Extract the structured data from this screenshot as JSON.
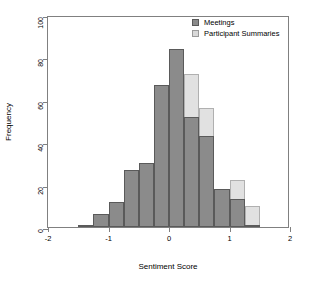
{
  "chart_data": {
    "type": "bar",
    "subtype": "overlapping-histogram",
    "title": "",
    "xlabel": "Sentiment Score",
    "ylabel": "Frequency",
    "xlim": [
      -2,
      2
    ],
    "ylim": [
      0,
      100
    ],
    "xticks": [
      -2,
      -1,
      0,
      1,
      2
    ],
    "xtick_labels": [
      "-2",
      "-1",
      "0",
      "1",
      "2"
    ],
    "yticks": [
      0,
      20,
      40,
      60,
      80,
      100
    ],
    "ytick_labels": [
      "0",
      "20",
      "40",
      "60",
      "80",
      "100"
    ],
    "grid": false,
    "legend_position": "top-right",
    "bin_width": 0.25,
    "bin_edges": [
      -1.5,
      -1.25,
      -1.0,
      -0.75,
      -0.5,
      -0.25,
      0.0,
      0.25,
      0.5,
      0.75,
      1.0,
      1.25,
      1.5
    ],
    "bin_centers": [
      -1.375,
      -1.125,
      -0.875,
      -0.625,
      -0.375,
      -0.125,
      0.125,
      0.375,
      0.625,
      0.875,
      1.125,
      1.375
    ],
    "series": [
      {
        "name": "Meetings",
        "color": "#8b8b8b",
        "values": [
          1,
          6,
          12,
          27,
          30,
          67,
          84,
          52,
          43,
          18,
          13,
          1
        ]
      },
      {
        "name": "Participant Summaries",
        "color": "#d9d9d9",
        "values": [
          1,
          1,
          3,
          9,
          19,
          57,
          52,
          72,
          56,
          18,
          22,
          10
        ]
      }
    ]
  },
  "axes": {
    "xlabel": "Sentiment Score",
    "ylabel": "Frequency"
  },
  "legend": {
    "items": [
      {
        "label": "Meetings",
        "swatch": "meet"
      },
      {
        "label": "Participant Summaries",
        "swatch": "part"
      }
    ]
  }
}
